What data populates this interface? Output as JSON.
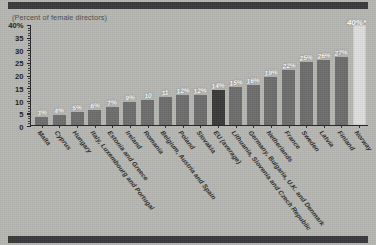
{
  "figure": {
    "subtitle": "(Percent of female directors)",
    "corner_note": "40%*"
  },
  "chart_data": {
    "type": "bar",
    "title": "",
    "subtitle": "(Percent of female directors)",
    "xlabel": "",
    "ylabel": "",
    "ylim": [
      0,
      40
    ],
    "yticks": [
      0,
      5,
      10,
      15,
      20,
      25,
      30,
      35,
      40
    ],
    "ytick_labels": [
      "0",
      "5",
      "10",
      "15",
      "20",
      "25",
      "30",
      "35",
      "40%"
    ],
    "grid": false,
    "legend": "none",
    "annotations": [
      "40%*"
    ],
    "categories": [
      "Malta",
      "Cyprus",
      "Hungary",
      "Italy, Luxembourg and Portugal",
      "Estonia and Greece",
      "Ireland",
      "Romania",
      "Belgium, Austria and Spain",
      "Poland",
      "Slovakia",
      "EU (average)",
      "Lithuania, Slovenia and Czech Republic",
      "Germany, Bulgaria, U.K. and Denmark",
      "Netherlands",
      "France",
      "Sweden",
      "Latvia",
      "Finland",
      "Norway"
    ],
    "values": [
      3,
      4,
      5,
      6,
      7,
      9,
      10,
      11,
      12,
      12,
      14,
      15,
      16,
      19,
      22,
      25,
      26,
      27,
      40
    ],
    "data_labels": [
      "3%",
      "4%",
      "5%",
      "6%",
      "7%",
      "9%",
      "10",
      "11",
      "12%",
      "12%",
      "14%",
      "15%",
      "16%",
      "19%",
      "22%",
      "25%",
      "26%",
      "27%",
      "40%*"
    ],
    "highlight_index": 10,
    "special_index": 18,
    "colors": {
      "bar": "#6e6e6e",
      "bar_highlight": "#3b3b3b",
      "bar_special": "#dedede",
      "background": "#b6b6b2",
      "axis": "#232323",
      "rule": "#3a3a3c",
      "label_text": "#2b2b2b",
      "data_label_text": "#ffffff"
    },
    "category_label_lines": [
      [
        "Malta"
      ],
      [
        "Cyprus"
      ],
      [
        "Hungary"
      ],
      [
        "Italy, Luxembourg and Portugal"
      ],
      [
        "Estonia and Greece"
      ],
      [
        "Ireland"
      ],
      [
        "Romania"
      ],
      [
        "Belgium, Austria and Spain"
      ],
      [
        "Poland"
      ],
      [
        "Slovakia"
      ],
      [
        "EU (average)"
      ],
      [
        "Lithuania, Slovenia and Czech Republic"
      ],
      [
        "Germany, Bulgaria, U.K. and Denmark"
      ],
      [
        "Netherlands"
      ],
      [
        "France"
      ],
      [
        "Sweden"
      ],
      [
        "Latvia"
      ],
      [
        "Finland"
      ],
      [
        "Norway"
      ]
    ]
  }
}
